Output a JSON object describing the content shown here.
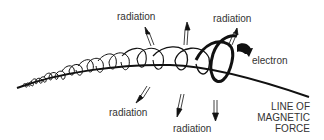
{
  "diagram": {
    "labels": {
      "radiation_top_left": "radiation",
      "radiation_top_right": "radiation",
      "radiation_bottom_left": "radiation",
      "radiation_bottom_right": "radiation",
      "electron": "electron",
      "field_line_1": "LINE OF",
      "field_line_2": "MAGNETIC",
      "field_line_3": "FORCE"
    },
    "colors": {
      "ink": "#111111",
      "text": "#333333",
      "background": "#ffffff"
    }
  }
}
